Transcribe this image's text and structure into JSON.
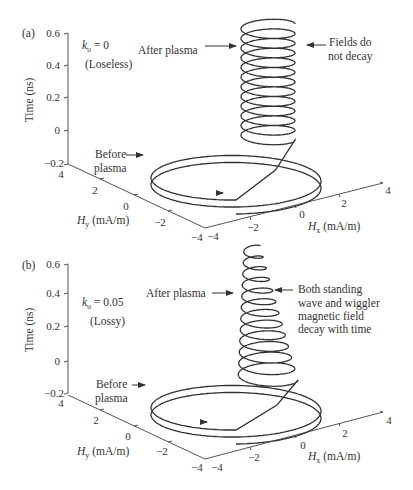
{
  "figure": {
    "panels": [
      {
        "id": "a",
        "label": "(a)",
        "param_label": "k",
        "param_sub": "υ",
        "param_value": " = 0",
        "condition": "(Loseless)",
        "after_label": "After plasma",
        "before_label_1": "Before",
        "before_label_2": "plasma",
        "note_lines": [
          "Fields do",
          "not decay"
        ]
      },
      {
        "id": "b",
        "label": "(b)",
        "param_label": "k",
        "param_sub": "υ",
        "param_value": " = 0.05",
        "condition": "(Lossy)",
        "after_label": "After plasma",
        "before_label_1": "Before",
        "before_label_2": "plasma",
        "note_lines": [
          "Both standing",
          "wave and wiggler",
          "magnetic field",
          "decay with time"
        ]
      }
    ],
    "axes": {
      "z_label": "Time (ns)",
      "z_ticks": [
        "0.6",
        "0.4",
        "0.2",
        "0",
        "−0.2"
      ],
      "y_label_main": "H",
      "y_label_sub": "y",
      "y_label_unit": " (mA/m)",
      "y_ticks": [
        "4",
        "2",
        "0",
        "−2",
        "−4"
      ],
      "x_label_main": "H",
      "x_label_sub": "x",
      "x_label_unit": " (mA/m)",
      "x_ticks": [
        "−4",
        "−2",
        "0",
        "2",
        "4"
      ]
    }
  },
  "chart_data": [
    {
      "type": "line",
      "subtype": "3d-parametric",
      "title": "(a) kυ = 0 (Loseless)",
      "xlabel": "Hx (mA/m)",
      "ylabel": "Hy (mA/m)",
      "zlabel": "Time (ns)",
      "xlim": [
        -4,
        4
      ],
      "ylim": [
        -4,
        4
      ],
      "zlim": [
        -0.2,
        0.6
      ],
      "x_ticks": [
        -4,
        -2,
        0,
        2,
        4
      ],
      "y_ticks": [
        -4,
        -2,
        0,
        2,
        4
      ],
      "z_ticks": [
        -0.2,
        0,
        0.2,
        0.4,
        0.6
      ],
      "series": [
        {
          "name": "Before plasma",
          "description": "circular polarization of radius ~4 mA/m, ~2 turns from t=-0.2 to 0 ns"
        },
        {
          "name": "After plasma",
          "description": "helix of radius ~1.3 mA/m, ~12 turns from t=0 to 0.6 ns, constant amplitude"
        }
      ],
      "annotations": [
        "After plasma",
        "Before plasma",
        "Fields do not decay",
        "kυ = 0",
        "(Loseless)"
      ]
    },
    {
      "type": "line",
      "subtype": "3d-parametric",
      "title": "(b) kυ = 0.05 (Lossy)",
      "xlabel": "Hx (mA/m)",
      "ylabel": "Hy (mA/m)",
      "zlabel": "Time (ns)",
      "xlim": [
        -4,
        4
      ],
      "ylim": [
        -4,
        4
      ],
      "zlim": [
        -0.2,
        0.6
      ],
      "x_ticks": [
        -4,
        -2,
        0,
        2,
        4
      ],
      "y_ticks": [
        -4,
        -2,
        0,
        2,
        4
      ],
      "z_ticks": [
        -0.2,
        0,
        0.2,
        0.4,
        0.6
      ],
      "series": [
        {
          "name": "Before plasma",
          "description": "circular polarization of radius ~4 mA/m, ~2 turns from t=-0.2 to 0 ns"
        },
        {
          "name": "After plasma",
          "description": "helix with decaying radius (from ~1.5 to ~0.4 mA/m), ~12 turns from t=0 to 0.6 ns"
        }
      ],
      "annotations": [
        "After plasma",
        "Before plasma",
        "Both standing wave and wiggler magnetic field decay with time",
        "kυ = 0.05",
        "(Lossy)"
      ]
    }
  ]
}
